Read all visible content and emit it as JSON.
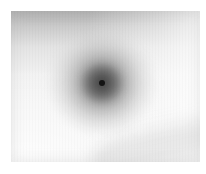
{
  "figure": {
    "kind": "grayscale-radial-blob-image",
    "canvas": {
      "width": 206,
      "height": 174,
      "paper_color": "#ffffff"
    },
    "frame": {
      "left": 11,
      "top": 11,
      "width": 189,
      "height": 151,
      "field_color": "#f4f4f4"
    },
    "features": [
      {
        "name": "top-shading-band",
        "type": "gradient-band",
        "position": "top edge",
        "tone": "#969696",
        "falloff": "fades to transparent by 62% height"
      },
      {
        "name": "halo",
        "type": "radial-gradient-blob",
        "center_x_pct": 48,
        "center_y_pct": 48,
        "width": 104,
        "height": 98,
        "core_tone": "#545454",
        "edge_tone": "#ffffff"
      },
      {
        "name": "halo-core",
        "type": "radial-gradient-blob",
        "center_x_pct": 48,
        "center_y_pct": 48,
        "width": 40,
        "height": 38,
        "core_tone": "#383838"
      },
      {
        "name": "nucleus",
        "type": "point",
        "center_x_pct": 48,
        "center_y_pct": 48,
        "diameter": 6,
        "tone": "#141414"
      },
      {
        "name": "diagonal-band",
        "type": "soft-diagonal-shading",
        "position": "lower right",
        "rotation_deg": -12,
        "tone": "#c4c4c4"
      }
    ]
  }
}
